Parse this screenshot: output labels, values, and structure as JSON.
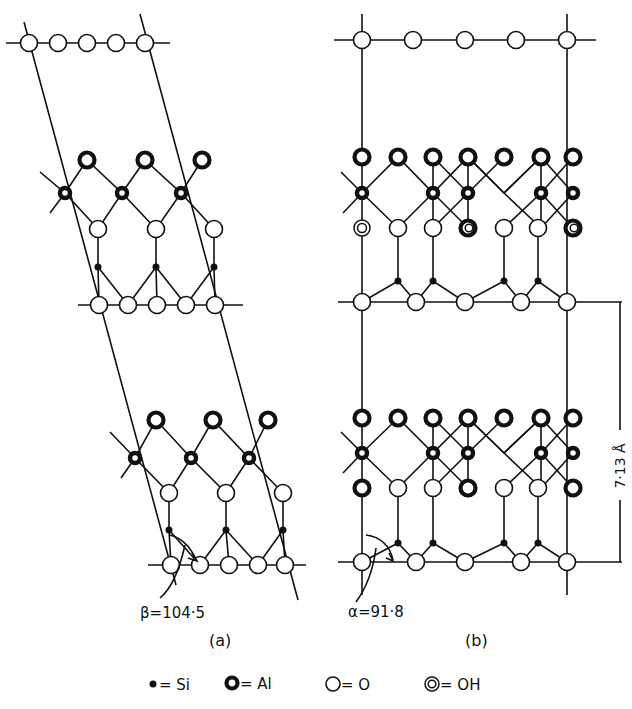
{
  "figure": {
    "panel_a": {
      "label": "(a)",
      "angle_label": "β=104·5",
      "cell_type": "monoclinic (slanted)"
    },
    "panel_b": {
      "label": "(b)",
      "angle_label": "α=91·8",
      "cell_type": "near-orthogonal",
      "dimension_label": "7·13 Å"
    },
    "legend": {
      "items": [
        {
          "symbol": "si-dot",
          "label": "= Si"
        },
        {
          "symbol": "al-ring",
          "label": "= Al"
        },
        {
          "symbol": "o-circle",
          "label": "= O"
        },
        {
          "symbol": "oh-double-ring",
          "label": "= OH"
        }
      ]
    },
    "colors": {
      "ink": "#111111",
      "background": "#ffffff"
    }
  }
}
